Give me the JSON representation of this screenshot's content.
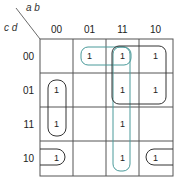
{
  "kmap": {
    "var_cols": "a b",
    "var_rows": "c d",
    "col_labels": [
      "00",
      "01",
      "11",
      "10"
    ],
    "row_labels": [
      "00",
      "01",
      "11",
      "10"
    ],
    "cells": [
      [
        "",
        "1",
        "1",
        "1"
      ],
      [
        "1",
        "",
        "1",
        "1"
      ],
      [
        "1",
        "",
        "1",
        ""
      ],
      [
        "1",
        "",
        "1",
        "1"
      ]
    ],
    "colors": {
      "grid": "#555555",
      "group_dark": "#333333",
      "group_teal": "#4a9a9a"
    }
  }
}
